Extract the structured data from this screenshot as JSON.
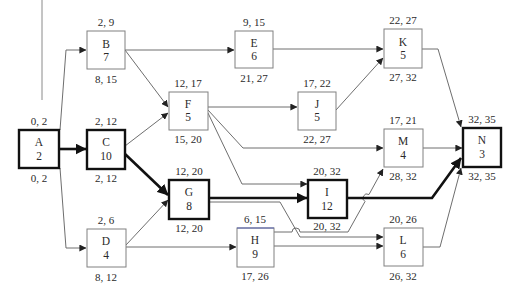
{
  "diagram": {
    "type": "activity-on-node network (critical path)",
    "legend_note": "top label = earliest start, earliest finish; bottom label = latest start, latest finish",
    "nodes": {
      "A": {
        "name": "A",
        "duration": "2",
        "top": "0, 2",
        "bottom": "0, 2",
        "critical": true
      },
      "B": {
        "name": "B",
        "duration": "7",
        "top": "2, 9",
        "bottom": "8, 15",
        "critical": false
      },
      "C": {
        "name": "C",
        "duration": "10",
        "top": "2, 12",
        "bottom": "2, 12",
        "critical": true
      },
      "D": {
        "name": "D",
        "duration": "4",
        "top": "2, 6",
        "bottom": "8, 12",
        "critical": false
      },
      "E": {
        "name": "E",
        "duration": "6",
        "top": "9, 15",
        "bottom": "21, 27",
        "critical": false
      },
      "F": {
        "name": "F",
        "duration": "5",
        "top": "12, 17",
        "bottom": "15, 20",
        "critical": false
      },
      "G": {
        "name": "G",
        "duration": "8",
        "top": "12, 20",
        "bottom": "12, 20",
        "critical": true
      },
      "H": {
        "name": "H",
        "duration": "9",
        "top": "6, 15",
        "bottom": "17, 26",
        "critical": false
      },
      "I": {
        "name": "I",
        "duration": "12",
        "top": "20, 32",
        "bottom": "20, 32",
        "critical": true
      },
      "J": {
        "name": "J",
        "duration": "5",
        "top": "17, 22",
        "bottom": "22, 27",
        "critical": false
      },
      "K": {
        "name": "K",
        "duration": "5",
        "top": "22, 27",
        "bottom": "27, 32",
        "critical": false
      },
      "L": {
        "name": "L",
        "duration": "6",
        "top": "20, 26",
        "bottom": "26, 32",
        "critical": false
      },
      "M": {
        "name": "M",
        "duration": "4",
        "top": "17, 21",
        "bottom": "28, 32",
        "critical": false
      },
      "N": {
        "name": "N",
        "duration": "3",
        "top": "32, 35",
        "bottom": "32, 35",
        "critical": true
      }
    },
    "edges": [
      {
        "from": "A",
        "to": "B",
        "critical": false
      },
      {
        "from": "A",
        "to": "C",
        "critical": true
      },
      {
        "from": "A",
        "to": "D",
        "critical": false
      },
      {
        "from": "B",
        "to": "E",
        "critical": false
      },
      {
        "from": "B",
        "to": "F",
        "critical": false
      },
      {
        "from": "C",
        "to": "F",
        "critical": false
      },
      {
        "from": "C",
        "to": "G",
        "critical": true
      },
      {
        "from": "D",
        "to": "G",
        "critical": false
      },
      {
        "from": "D",
        "to": "H",
        "critical": false
      },
      {
        "from": "E",
        "to": "K",
        "critical": false
      },
      {
        "from": "F",
        "to": "J",
        "critical": false
      },
      {
        "from": "F",
        "to": "M",
        "critical": false
      },
      {
        "from": "F",
        "to": "I",
        "critical": false
      },
      {
        "from": "J",
        "to": "K",
        "critical": false
      },
      {
        "from": "G",
        "to": "I",
        "critical": true
      },
      {
        "from": "G",
        "to": "L",
        "critical": false
      },
      {
        "from": "H",
        "to": "M",
        "critical": false
      },
      {
        "from": "H",
        "to": "L",
        "critical": false
      },
      {
        "from": "K",
        "to": "N",
        "critical": false
      },
      {
        "from": "M",
        "to": "N",
        "critical": false
      },
      {
        "from": "I",
        "to": "N",
        "critical": true
      },
      {
        "from": "L",
        "to": "N",
        "critical": false
      }
    ],
    "critical_path": [
      "A",
      "C",
      "G",
      "I",
      "N"
    ],
    "colors": {
      "critical": "#111111",
      "normal": "#6e6e6e",
      "box_border": "#808080"
    }
  }
}
